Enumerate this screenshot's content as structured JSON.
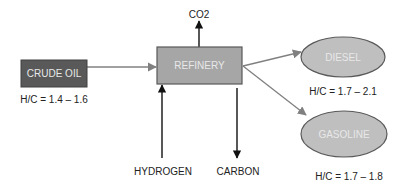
{
  "diagram": {
    "type": "process-flow",
    "nodes": {
      "crude_oil": {
        "label": "CRUDE OIL",
        "ratio": "H/C = 1.4 – 1.6",
        "shape": "rectangle",
        "fill": "#595959",
        "stroke": "#404040"
      },
      "refinery": {
        "label": "REFINERY",
        "shape": "rectangle",
        "fill": "#a6a6a6",
        "stroke": "#595959"
      },
      "diesel": {
        "label": "DIESEL",
        "ratio": "H/C = 1.7 – 2.1",
        "shape": "ellipse",
        "fill": "#bfbfbf",
        "stroke": "#595959"
      },
      "gasoline": {
        "label": "GASOLINE",
        "ratio": "H/C = 1.7 – 1.8",
        "shape": "ellipse",
        "fill": "#bfbfbf",
        "stroke": "#595959"
      }
    },
    "inputs": {
      "hydrogen": "HYDROGEN"
    },
    "outputs": {
      "co2": "CO2",
      "carbon": "CARBON"
    },
    "edges": [
      {
        "from": "crude_oil",
        "to": "refinery",
        "color": "#808080"
      },
      {
        "from": "refinery",
        "to": "diesel",
        "color": "#808080"
      },
      {
        "from": "refinery",
        "to": "gasoline",
        "color": "#808080"
      },
      {
        "from": "hydrogen",
        "to": "refinery",
        "color": "#000000"
      },
      {
        "from": "refinery",
        "to": "carbon",
        "color": "#000000"
      },
      {
        "from": "refinery",
        "to": "co2",
        "color": "#000000"
      }
    ]
  }
}
